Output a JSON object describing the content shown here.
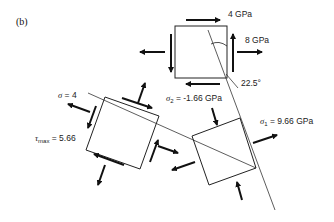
{
  "figure": {
    "panel_label": "(b)",
    "original_element": {
      "shear_stress": "4 GPa",
      "normal_stress": "8 GPa",
      "angle": "22.5°"
    },
    "principal_element": {
      "sigma2_symbol": "σ",
      "sigma2_sub": "2",
      "sigma2_value": " = -1.66 GPa",
      "sigma1_symbol": "σ",
      "sigma1_sub": "1",
      "sigma1_value": " = 9.66 GPa"
    },
    "max_shear_element": {
      "sigma_symbol": "σ",
      "sigma_value": " = 4",
      "tau_symbol": "τ",
      "tau_sub": "max",
      "tau_value": " = 5.66"
    }
  }
}
